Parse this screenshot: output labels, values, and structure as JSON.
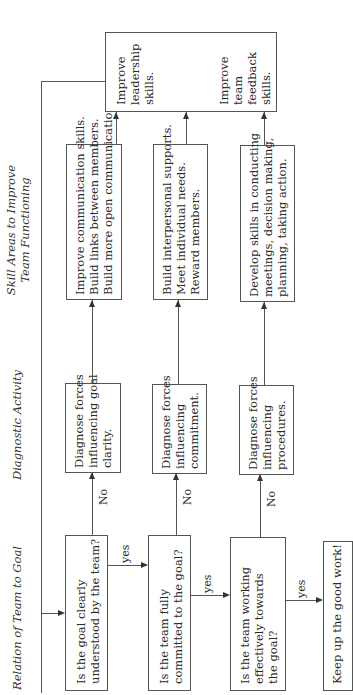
{
  "headers": {
    "relation": "Relation of Team to Goal",
    "diagnostic": "Diagnostic Activity",
    "skill_line1": "Skill Areas to Improve",
    "skill_line2": "Team Functioning"
  },
  "questions": [
    {
      "line1": "Is the goal clearly",
      "line2": "understood by the team?"
    },
    {
      "line1": "Is the team fully",
      "line2": "committed to the goal?"
    },
    {
      "line1": "Is the team working",
      "line2": "effectively towards",
      "line3": "the goal?"
    }
  ],
  "final": "Keep up the good work!",
  "diagnostics": [
    {
      "line1": "Diagnose forces",
      "line2": "influencing goal",
      "line3": "clarity."
    },
    {
      "line1": "Diagnose forces",
      "line2": "influencing",
      "line3": "commitment."
    },
    {
      "line1": "Diagnose forces",
      "line2": "influencing",
      "line3": "procedures."
    }
  ],
  "skills": [
    {
      "line1": "Improve communication skills.",
      "line2": "Build links between members.",
      "line3": "Build more open communication."
    },
    {
      "line1": "Build interpersonal supports.",
      "line2": "Meet individual needs.",
      "line3": "Reward members."
    },
    {
      "line1": "Develop skills in conducting",
      "line2": "meetings, decision making,",
      "line3": "planning, taking action."
    }
  ],
  "top_box": {
    "leadership": {
      "line1": "Improve",
      "line2": "leadership",
      "line3": "skills."
    },
    "feedback": {
      "line1": "Improve",
      "line2": "team",
      "line3": "feedback",
      "line4": "skills."
    }
  },
  "edge_labels": {
    "no": "No",
    "yes": "yes"
  }
}
